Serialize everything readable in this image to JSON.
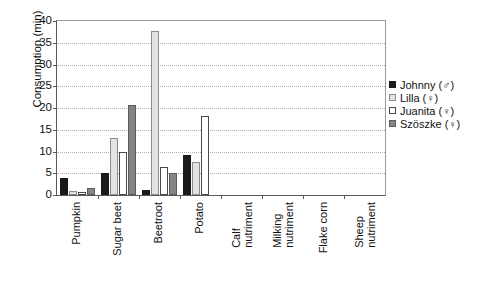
{
  "chart_data": {
    "type": "bar",
    "title": "",
    "xlabel": "",
    "ylabel": "Consumption (min)",
    "ylim": [
      0,
      40
    ],
    "ytick_step": 5,
    "yticks": [
      0,
      5,
      10,
      15,
      20,
      25,
      30,
      35,
      40
    ],
    "grid": true,
    "legend_position": "right",
    "categories": [
      "Pumpkin",
      "Sugar beet",
      "Beetroot",
      "Potato",
      "Calf nutriment",
      "Milking nutriment",
      "Flake corn",
      "Sheep nutriment"
    ],
    "category_lines": [
      [
        "Pumpkin"
      ],
      [
        "Sugar beet"
      ],
      [
        "Beetroot"
      ],
      [
        "Potato"
      ],
      [
        "Calf",
        "nutriment"
      ],
      [
        "Milking",
        "nutriment"
      ],
      [
        "Flake corn"
      ],
      [
        "Sheep",
        "nutriment"
      ]
    ],
    "series": [
      {
        "name": "Johnny (♂)",
        "color": "#1a1a1a",
        "values": [
          4.0,
          5.0,
          1.1,
          9.1,
          0,
          0,
          0,
          0
        ]
      },
      {
        "name": "Lilla (♀)",
        "color": "#e3e3e3",
        "values": [
          0.9,
          13.0,
          37.6,
          7.6,
          0,
          0,
          0,
          0
        ]
      },
      {
        "name": "Juanita (♀)",
        "color": "#ffffff",
        "values": [
          0.6,
          10.0,
          6.5,
          18.1,
          0,
          0,
          0,
          0
        ]
      },
      {
        "name": "Szöszke (♀)",
        "color": "#848484",
        "values": [
          1.6,
          20.6,
          5.0,
          0,
          0,
          0,
          0,
          0
        ]
      }
    ]
  },
  "legend": {
    "items": [
      {
        "label": "Johnny (♂)"
      },
      {
        "label": "Lilla (♀)"
      },
      {
        "label": "Juanita (♀)"
      },
      {
        "label": "Szöszke (♀)"
      }
    ]
  }
}
